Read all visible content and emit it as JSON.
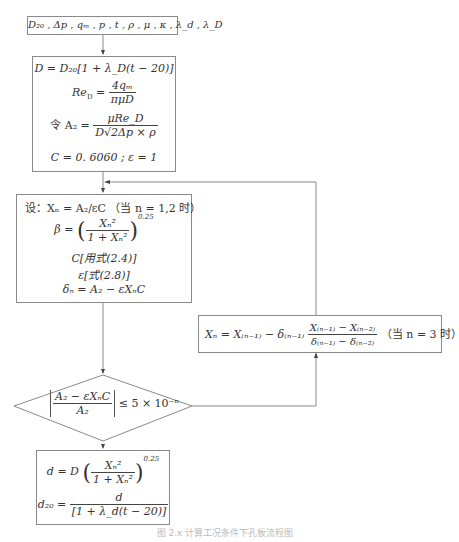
{
  "diagram": {
    "type": "flowchart",
    "input_box": {
      "label": "D₂₀ , Δp , qₘ , p , t , ρ , μ , κ , λ_d , λ_D"
    },
    "init_box": {
      "lines": [
        "D = D₂₀[1 + λ_D(t − 20)]",
        "Re_D = 4qₘ / (πμD)",
        "令 A₂ = μRe_D / (D√(2Δp × ρ))",
        "C = 0.6060 ; ε = 1"
      ],
      "line1": "D = D₂₀[1 + λ_D(t − 20)]",
      "line2_lhs": "Re",
      "line2_num": "4qₘ",
      "line2_den": "πμD",
      "line3_prefix": "令 A₂ =",
      "line3_num": "μRe_D",
      "line3_den": "D√2Δp × ρ",
      "line4": "C = 0. 6060 ; ε = 1"
    },
    "iter_box": {
      "line1": "设：Xₙ = A₂/εC  （当 n = 1,2 时）",
      "line2_lhs": "β =",
      "line2_num": "Xₙ²",
      "line2_den": "1 + Xₙ²",
      "line2_exp": "0.25",
      "line3": "C[用式(2.4)]",
      "line4": "ε[式(2.8)]",
      "line5": "δₙ = A₂ − εXₙC"
    },
    "decision": {
      "num": "A₂ − εXₙC",
      "den": "A₂",
      "rhs": "≤ 5 × 10⁻ⁿ"
    },
    "update_box": {
      "lhs": "Xₙ = X₍ₙ₋₁₎ − δ₍ₙ₋₁₎",
      "num": "X₍ₙ₋₁₎ − X₍ₙ₋₂₎",
      "den": "δ₍ₙ₋₁₎ − δ₍ₙ₋₂₎",
      "note": "（当 n = 3 时）"
    },
    "result_box": {
      "line1_lhs": "d = D",
      "line1_num": "Xₙ²",
      "line1_den": "1 + Xₙ²",
      "line1_exp": "0.25",
      "line2_lhs": "d₂₀ =",
      "line2_num": "d",
      "line2_den": "[1 + λ_d(t − 20)]"
    },
    "caption": "图 2.x  计算工况条件下孔板流程图",
    "colors": {
      "stroke": "#8a8a8a",
      "text": "#333333",
      "background": "#ffffff"
    }
  }
}
